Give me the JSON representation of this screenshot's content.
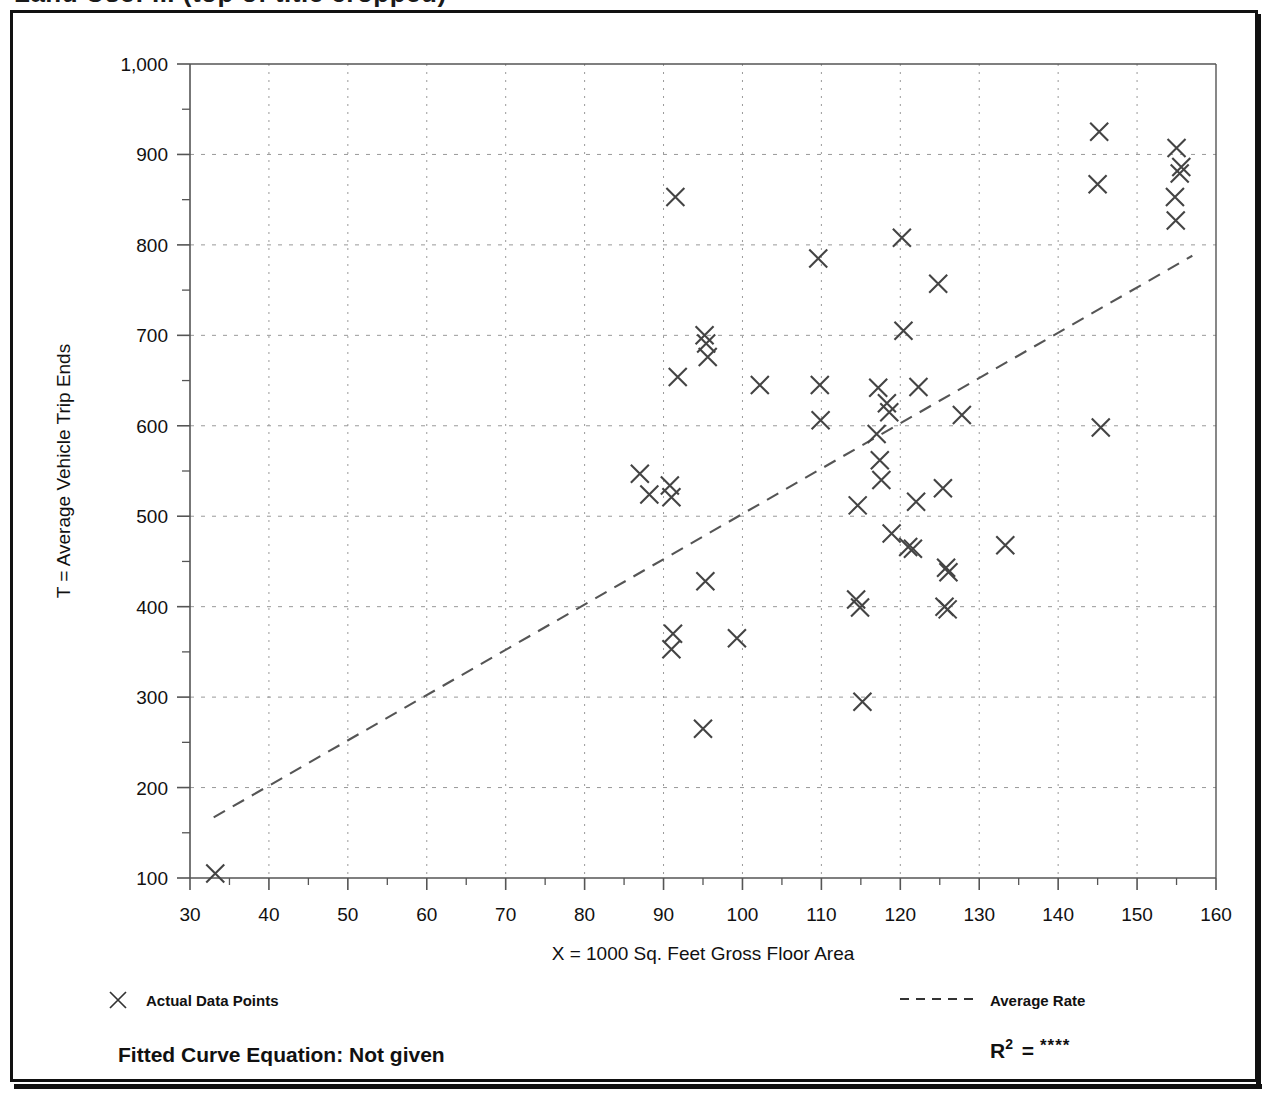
{
  "figure": {
    "title_partial": "Land Use: ... (top of title cropped)",
    "frame_color": "#111111",
    "background": "#ffffff",
    "marker_color": "#444444",
    "grid_color": "#999999",
    "axis_color": "#555555"
  },
  "chart_data": {
    "type": "scatter",
    "title": "",
    "xlabel": "X = 1000 Sq. Feet Gross Floor Area",
    "ylabel": "T = Average Vehicle Trip Ends",
    "xlim": [
      30,
      160
    ],
    "ylim": [
      100,
      1000
    ],
    "xticks": [
      30,
      40,
      50,
      60,
      70,
      80,
      90,
      100,
      110,
      120,
      130,
      140,
      150,
      160
    ],
    "yticks": [
      100,
      200,
      300,
      400,
      500,
      600,
      700,
      800,
      900,
      1000
    ],
    "ytick_labels": [
      "100",
      "200",
      "300",
      "400",
      "500",
      "600",
      "700",
      "800",
      "900",
      "1,000"
    ],
    "minor_y_ticks": [
      150,
      250,
      350,
      450,
      550,
      650,
      750,
      850,
      950
    ],
    "grid": true,
    "grid_style": "dotted",
    "legend_position": "below-axes",
    "series": [
      {
        "name": "Actual Data Points",
        "marker": "x",
        "points": [
          [
            33.2,
            105
          ],
          [
            87.0,
            547
          ],
          [
            88.2,
            524
          ],
          [
            90.8,
            534
          ],
          [
            91.0,
            521
          ],
          [
            91.5,
            853
          ],
          [
            91.8,
            654
          ],
          [
            91.2,
            370
          ],
          [
            91.0,
            353
          ],
          [
            95.2,
            700
          ],
          [
            95.4,
            691
          ],
          [
            95.6,
            676
          ],
          [
            95.3,
            428
          ],
          [
            95.0,
            265
          ],
          [
            99.3,
            365
          ],
          [
            102.2,
            645
          ],
          [
            109.6,
            785
          ],
          [
            109.8,
            645
          ],
          [
            109.9,
            606
          ],
          [
            114.6,
            512
          ],
          [
            114.4,
            408
          ],
          [
            114.9,
            399
          ],
          [
            115.2,
            295
          ],
          [
            117.2,
            642
          ],
          [
            117.0,
            591
          ],
          [
            117.4,
            562
          ],
          [
            117.6,
            540
          ],
          [
            118.3,
            625
          ],
          [
            118.6,
            615
          ],
          [
            118.9,
            481
          ],
          [
            120.2,
            808
          ],
          [
            120.4,
            705
          ],
          [
            121.0,
            466
          ],
          [
            121.6,
            464
          ],
          [
            122.3,
            643
          ],
          [
            122.0,
            516
          ],
          [
            124.8,
            757
          ],
          [
            125.4,
            531
          ],
          [
            125.8,
            443
          ],
          [
            126.1,
            438
          ],
          [
            125.6,
            400
          ],
          [
            126.0,
            397
          ],
          [
            127.8,
            612
          ],
          [
            133.3,
            468
          ],
          [
            145.2,
            925
          ],
          [
            145.0,
            867
          ],
          [
            145.4,
            598
          ],
          [
            155.0,
            907
          ],
          [
            155.6,
            886
          ],
          [
            155.4,
            879
          ],
          [
            154.8,
            853
          ],
          [
            154.9,
            827
          ]
        ]
      }
    ],
    "trendline": {
      "name": "Average Rate",
      "style": "dashed",
      "x0": 33.0,
      "y0": 167,
      "x1": 157.0,
      "y1": 788
    }
  },
  "legend": {
    "marker_entry_label": "Actual Data Points",
    "marker_glyph": "x-marker-icon",
    "line_entry_label": "Average Rate",
    "line_glyph": "dashed-line-icon"
  },
  "footer": {
    "equation_label": "Fitted Curve Equation:  Not given",
    "r2_base": "R",
    "r2_exponent": "2",
    "r2_equals": "=",
    "r2_value": "****"
  }
}
